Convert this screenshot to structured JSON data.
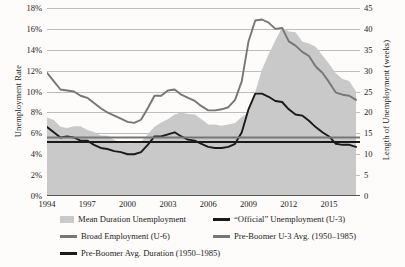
{
  "chart_data": {
    "type": "line",
    "title": "",
    "xlabel": "",
    "ylabel": "Unemployment Rate",
    "ylabel_right": "Length of Unemployment (weeks)",
    "xlim": [
      1994,
      2017.3
    ],
    "ylim": [
      0,
      18
    ],
    "ylim_right": [
      0,
      45
    ],
    "grid": true,
    "legend_position": "below",
    "x_ticks": [
      "1994",
      "1997",
      "2000",
      "2003",
      "2006",
      "2009",
      "2012",
      "2015"
    ],
    "x_tick_values": [
      1994,
      1997,
      2000,
      2003,
      2006,
      2009,
      2012,
      2015
    ],
    "y_ticks_left": [
      "0%",
      "2%",
      "4%",
      "6%",
      "8%",
      "10%",
      "12%",
      "14%",
      "16%",
      "18%"
    ],
    "y_tick_values_left": [
      0,
      2,
      4,
      6,
      8,
      10,
      12,
      14,
      16,
      18
    ],
    "y_ticks_right": [
      "0",
      "5",
      "10",
      "15",
      "20",
      "25",
      "30",
      "35",
      "40",
      "45"
    ],
    "y_tick_values_right": [
      0,
      5,
      10,
      15,
      20,
      25,
      30,
      35,
      40,
      45
    ],
    "series": [
      {
        "name": "Mean Duration Unemployment",
        "type": "area",
        "axis": "right",
        "color": "#c9c9c9",
        "x": [
          1994.0,
          1994.5,
          1995.0,
          1995.5,
          1996.0,
          1996.5,
          1997.0,
          1997.5,
          1998.0,
          1998.5,
          1999.0,
          1999.5,
          2000.0,
          2000.5,
          2001.0,
          2001.5,
          2002.0,
          2002.5,
          2003.0,
          2003.5,
          2004.0,
          2004.5,
          2005.0,
          2005.5,
          2006.0,
          2006.5,
          2007.0,
          2007.5,
          2008.0,
          2008.5,
          2009.0,
          2009.5,
          2010.0,
          2010.5,
          2011.0,
          2011.5,
          2012.0,
          2012.5,
          2013.0,
          2013.5,
          2014.0,
          2014.5,
          2015.0,
          2015.5,
          2016.0,
          2016.5,
          2017.0
        ],
        "y": [
          18.8,
          18.2,
          16.6,
          16.3,
          16.7,
          16.7,
          15.8,
          15.3,
          14.5,
          14.4,
          13.4,
          13.0,
          12.6,
          12.7,
          13.0,
          14.8,
          16.6,
          17.6,
          18.4,
          19.5,
          20.0,
          19.6,
          19.5,
          18.4,
          17.1,
          17.1,
          16.8,
          17.1,
          17.5,
          18.9,
          20.0,
          24.9,
          30.3,
          33.9,
          37.2,
          40.4,
          39.4,
          39.2,
          37.0,
          36.5,
          35.7,
          33.7,
          31.6,
          29.4,
          28.0,
          27.5,
          25.0
        ]
      },
      {
        "name": "“Official” Unemployment (U-3)",
        "type": "line",
        "axis": "left",
        "color": "#1a1a1a",
        "x": [
          1994.0,
          1994.5,
          1995.0,
          1995.5,
          1996.0,
          1996.5,
          1997.0,
          1997.5,
          1998.0,
          1998.5,
          1999.0,
          1999.5,
          2000.0,
          2000.5,
          2001.0,
          2001.5,
          2002.0,
          2002.5,
          2003.0,
          2003.5,
          2004.0,
          2004.5,
          2005.0,
          2005.5,
          2006.0,
          2006.5,
          2007.0,
          2007.5,
          2008.0,
          2008.5,
          2009.0,
          2009.5,
          2010.0,
          2010.5,
          2011.0,
          2011.5,
          2012.0,
          2012.5,
          2013.0,
          2013.5,
          2014.0,
          2014.5,
          2015.0,
          2015.5,
          2016.0,
          2016.5,
          2017.0
        ],
        "y": [
          6.6,
          6.1,
          5.6,
          5.7,
          5.6,
          5.3,
          5.3,
          4.9,
          4.6,
          4.5,
          4.3,
          4.2,
          4.0,
          4.0,
          4.2,
          4.9,
          5.7,
          5.7,
          5.9,
          6.1,
          5.7,
          5.4,
          5.3,
          5.0,
          4.7,
          4.6,
          4.6,
          4.7,
          5.0,
          6.1,
          8.3,
          9.8,
          9.8,
          9.5,
          9.1,
          9.0,
          8.3,
          7.8,
          7.7,
          7.2,
          6.6,
          6.1,
          5.7,
          5.0,
          4.9,
          4.9,
          4.7
        ]
      },
      {
        "name": "Broad Employment (U-6)",
        "type": "line",
        "axis": "left",
        "color": "#767676",
        "x": [
          1994.0,
          1994.5,
          1995.0,
          1995.5,
          1996.0,
          1996.5,
          1997.0,
          1997.5,
          1998.0,
          1998.5,
          1999.0,
          1999.5,
          2000.0,
          2000.5,
          2001.0,
          2001.5,
          2002.0,
          2002.5,
          2003.0,
          2003.5,
          2004.0,
          2004.5,
          2005.0,
          2005.5,
          2006.0,
          2006.5,
          2007.0,
          2007.5,
          2008.0,
          2008.5,
          2009.0,
          2009.5,
          2010.0,
          2010.5,
          2011.0,
          2011.5,
          2012.0,
          2012.5,
          2013.0,
          2013.5,
          2014.0,
          2014.5,
          2015.0,
          2015.5,
          2016.0,
          2016.5,
          2017.0
        ],
        "y": [
          11.8,
          11.0,
          10.2,
          10.1,
          10.0,
          9.6,
          9.4,
          8.9,
          8.4,
          8.0,
          7.7,
          7.4,
          7.1,
          7.0,
          7.3,
          8.4,
          9.6,
          9.6,
          10.1,
          10.2,
          9.7,
          9.4,
          9.1,
          8.6,
          8.2,
          8.2,
          8.3,
          8.5,
          9.2,
          11.0,
          14.8,
          16.8,
          16.9,
          16.6,
          16.0,
          16.1,
          14.8,
          14.4,
          13.8,
          13.4,
          12.4,
          11.8,
          10.9,
          9.9,
          9.7,
          9.6,
          9.2
        ]
      },
      {
        "name": "Pre-Boomer U-3 Avg. (1950–1985)",
        "type": "hline",
        "axis": "left",
        "color": "#767676",
        "value": 5.6
      },
      {
        "name": "Pre-Boomer Avg. Duration (1950–1985)",
        "type": "hline",
        "axis": "right",
        "color": "#1a1a1a",
        "value": 12.9
      }
    ]
  },
  "legend": {
    "items": [
      {
        "label": "Mean Duration Unemployment",
        "swatch": "area",
        "color": "#c9c9c9"
      },
      {
        "label": "Broad Employment (U-6)",
        "swatch": "line",
        "color": "#767676"
      },
      {
        "label": "Pre-Boomer Avg. Duration (1950–1985)",
        "swatch": "line",
        "color": "#1a1a1a"
      },
      {
        "label": "“Official” Unemployment (U-3)",
        "swatch": "line",
        "color": "#1a1a1a"
      },
      {
        "label": "Pre-Boomer U-3 Avg. (1950–1985)",
        "swatch": "line",
        "color": "#767676"
      }
    ]
  }
}
